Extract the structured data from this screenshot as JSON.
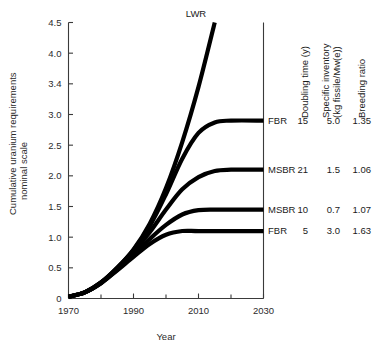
{
  "chart_data": {
    "type": "line",
    "title": "",
    "xlabel": "Year",
    "ylabel": "Cumulative uranium requirements",
    "ylabel_line2": "nominal scale",
    "xlim": [
      1970,
      2030
    ],
    "ylim": [
      0,
      4.5
    ],
    "grid": false,
    "legend_position": "right-table",
    "x_ticks_major": [
      "1970",
      "1990",
      "2010",
      "2030"
    ],
    "x_ticks_major_values": [
      1970,
      1990,
      2010,
      2030
    ],
    "x_ticks_minor_values": [
      1980,
      2000,
      2020
    ],
    "y_ticks": [
      "0",
      "0.5",
      "1.0",
      "1.5",
      "2.0",
      "2.5",
      "3.0",
      "3.4",
      "4.0",
      "4.5"
    ],
    "y_tick_values": [
      0,
      0.5,
      1.0,
      1.5,
      2.0,
      2.5,
      3.0,
      3.5,
      4.0,
      4.5
    ],
    "series": [
      {
        "name": "LWR",
        "label": "LWR",
        "label_position": "top",
        "plateau": null,
        "points": [
          {
            "x": 1970,
            "y": 0.03
          },
          {
            "x": 1975,
            "y": 0.1
          },
          {
            "x": 1980,
            "y": 0.26
          },
          {
            "x": 1985,
            "y": 0.5
          },
          {
            "x": 1990,
            "y": 0.8
          },
          {
            "x": 1995,
            "y": 1.22
          },
          {
            "x": 2000,
            "y": 1.8
          },
          {
            "x": 2005,
            "y": 2.55
          },
          {
            "x": 2010,
            "y": 3.45
          },
          {
            "x": 2015,
            "y": 4.5
          }
        ]
      },
      {
        "name": "FBR-15",
        "label": "FBR",
        "doubling_time": "15",
        "specific_inventory": "5.0",
        "breeding_ratio": "1.35",
        "plateau": 2.9,
        "points": [
          {
            "x": 1970,
            "y": 0.03
          },
          {
            "x": 1975,
            "y": 0.1
          },
          {
            "x": 1980,
            "y": 0.26
          },
          {
            "x": 1985,
            "y": 0.5
          },
          {
            "x": 1990,
            "y": 0.79
          },
          {
            "x": 1995,
            "y": 1.18
          },
          {
            "x": 2000,
            "y": 1.7
          },
          {
            "x": 2005,
            "y": 2.28
          },
          {
            "x": 2010,
            "y": 2.7
          },
          {
            "x": 2015,
            "y": 2.87
          },
          {
            "x": 2020,
            "y": 2.9
          },
          {
            "x": 2030,
            "y": 2.9
          }
        ]
      },
      {
        "name": "MSBR-21",
        "label": "MSBR",
        "doubling_time": "21",
        "specific_inventory": "1.5",
        "breeding_ratio": "1.06",
        "plateau": 2.1,
        "points": [
          {
            "x": 1970,
            "y": 0.03
          },
          {
            "x": 1975,
            "y": 0.1
          },
          {
            "x": 1980,
            "y": 0.26
          },
          {
            "x": 1985,
            "y": 0.49
          },
          {
            "x": 1990,
            "y": 0.76
          },
          {
            "x": 1995,
            "y": 1.08
          },
          {
            "x": 2000,
            "y": 1.45
          },
          {
            "x": 2005,
            "y": 1.78
          },
          {
            "x": 2010,
            "y": 1.98
          },
          {
            "x": 2015,
            "y": 2.08
          },
          {
            "x": 2020,
            "y": 2.1
          },
          {
            "x": 2030,
            "y": 2.1
          }
        ]
      },
      {
        "name": "MSBR-10",
        "label": "MSBR",
        "doubling_time": "10",
        "specific_inventory": "0.7",
        "breeding_ratio": "1.07",
        "plateau": 1.45,
        "points": [
          {
            "x": 1970,
            "y": 0.03
          },
          {
            "x": 1975,
            "y": 0.1
          },
          {
            "x": 1980,
            "y": 0.25
          },
          {
            "x": 1985,
            "y": 0.47
          },
          {
            "x": 1990,
            "y": 0.71
          },
          {
            "x": 1995,
            "y": 0.97
          },
          {
            "x": 2000,
            "y": 1.2
          },
          {
            "x": 2005,
            "y": 1.37
          },
          {
            "x": 2010,
            "y": 1.44
          },
          {
            "x": 2015,
            "y": 1.45
          },
          {
            "x": 2020,
            "y": 1.45
          },
          {
            "x": 2030,
            "y": 1.45
          }
        ]
      },
      {
        "name": "FBR-5",
        "label": "FBR",
        "doubling_time": "5",
        "specific_inventory": "3.0",
        "breeding_ratio": "1.63",
        "plateau": 1.1,
        "points": [
          {
            "x": 1970,
            "y": 0.03
          },
          {
            "x": 1975,
            "y": 0.1
          },
          {
            "x": 1980,
            "y": 0.25
          },
          {
            "x": 1985,
            "y": 0.46
          },
          {
            "x": 1990,
            "y": 0.68
          },
          {
            "x": 1995,
            "y": 0.89
          },
          {
            "x": 2000,
            "y": 1.04
          },
          {
            "x": 2005,
            "y": 1.1
          },
          {
            "x": 2010,
            "y": 1.1
          },
          {
            "x": 2020,
            "y": 1.1
          },
          {
            "x": 2030,
            "y": 1.1
          }
        ]
      }
    ]
  },
  "legend_table": {
    "columns": [
      {
        "id": "reactor",
        "header": ""
      },
      {
        "id": "doubling",
        "header": "Doubling time (y)"
      },
      {
        "id": "inventory",
        "header_line1": "Specific inventory",
        "header_line2": "(kg fissile/Mw(e))"
      },
      {
        "id": "breeding",
        "header": "Breeding ratio"
      }
    ],
    "rows": [
      {
        "reactor": "FBR",
        "doubling": "15",
        "inventory": "5.0",
        "breeding": "1.35"
      },
      {
        "reactor": "MSBR",
        "doubling": "21",
        "inventory": "1.5",
        "breeding": "1.06"
      },
      {
        "reactor": "MSBR",
        "doubling": "10",
        "inventory": "0.7",
        "breeding": "1.07"
      },
      {
        "reactor": "FBR",
        "doubling": "5",
        "inventory": "3.0",
        "breeding": "1.63"
      }
    ]
  },
  "colors": {
    "curve": "#000000",
    "axis": "#3a3a3a",
    "text": "#1a1a1a",
    "background": "#ffffff"
  }
}
